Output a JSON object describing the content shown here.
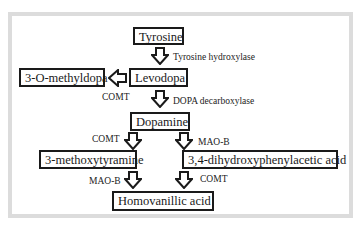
{
  "diagram": {
    "type": "metabolic-pathway",
    "nodes": {
      "tyrosine": "Tyrosine",
      "levodopa": "Levodopa",
      "omethyldopa": "3-O-methyldopa",
      "dopamine": "Dopamine",
      "methoxytyramine": "3-methoxytyramine",
      "dopac": "3,4-dihydroxyphenylacetic acid",
      "hva": "Homovanillic acid"
    },
    "enzymes": {
      "tyrosine_hydroxylase": "Tyrosine hydroxylase",
      "comt_levodopa": "COMT",
      "dopa_decarboxylase": "DOPA decarboxylase",
      "comt_dopamine": "COMT",
      "maob_dopamine": "MAO-B",
      "maob_3mt": "MAO-B",
      "comt_dopac": "COMT"
    },
    "edges": [
      {
        "from": "Tyrosine",
        "to": "Levodopa",
        "enzyme": "Tyrosine hydroxylase"
      },
      {
        "from": "Levodopa",
        "to": "3-O-methyldopa",
        "enzyme": "COMT"
      },
      {
        "from": "Levodopa",
        "to": "Dopamine",
        "enzyme": "DOPA decarboxylase"
      },
      {
        "from": "Dopamine",
        "to": "3-methoxytyramine",
        "enzyme": "COMT"
      },
      {
        "from": "Dopamine",
        "to": "3,4-dihydroxyphenylacetic acid",
        "enzyme": "MAO-B"
      },
      {
        "from": "3-methoxytyramine",
        "to": "Homovanillic acid",
        "enzyme": "MAO-B"
      },
      {
        "from": "3,4-dihydroxyphenylacetic acid",
        "to": "Homovanillic acid",
        "enzyme": "COMT"
      }
    ]
  }
}
